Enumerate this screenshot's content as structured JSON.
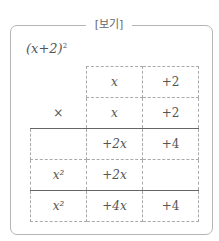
{
  "box": {
    "title": "[보기]",
    "expression": "(x+2)",
    "expression_exponent": "2"
  },
  "table": {
    "rows": [
      [
        "",
        "x",
        "+2"
      ],
      [
        "×",
        "x",
        "+2"
      ],
      [
        "",
        "+2x",
        "+4"
      ],
      [
        "x²",
        "+2x",
        ""
      ],
      [
        "x²",
        "+4x",
        "+4"
      ]
    ]
  }
}
